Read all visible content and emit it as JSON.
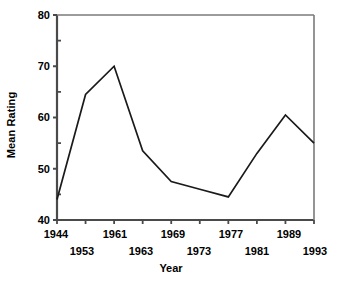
{
  "chart_data": {
    "type": "line",
    "title": "",
    "xlabel": "Year",
    "ylabel": "Mean Rating",
    "xlim": [
      1944,
      1993
    ],
    "ylim": [
      40,
      80
    ],
    "grid": false,
    "legend": null,
    "y_ticks": [
      40,
      50,
      60,
      70,
      80
    ],
    "y_tick_labels": [
      "40",
      "50",
      "60",
      "70",
      "80"
    ],
    "y_minor_ticks": [
      45,
      55,
      65,
      75
    ],
    "x_ticks": [
      1944,
      1953,
      1961,
      1963,
      1969,
      1973,
      1977,
      1981,
      1989,
      1993
    ],
    "x_tick_labels": [
      "1944",
      "1953",
      "1961",
      "1963",
      "1969",
      "1973",
      "1977",
      "1981",
      "1989",
      "1993"
    ],
    "x_tick_label_rows": [
      0,
      1,
      0,
      1,
      0,
      1,
      0,
      1,
      0,
      1
    ],
    "series": [
      {
        "name": "Mean Rating",
        "color": "#1a1a1a",
        "x": [
          1944,
          1953,
          1961,
          1963,
          1969,
          1973,
          1977,
          1981,
          1989,
          1993
        ],
        "values": [
          44.0,
          64.5,
          70.0,
          53.5,
          47.5,
          46.0,
          44.5,
          53.0,
          60.5,
          55.0
        ]
      }
    ]
  },
  "axis": {
    "y_title": "Mean Rating",
    "x_title": "Year",
    "y_labels": {
      "t80": "80",
      "t70": "70",
      "t60": "60",
      "t50": "50",
      "t40": "40"
    },
    "x_labels": {
      "t1944": "1944",
      "t1953": "1953",
      "t1961": "1961",
      "t1963": "1963",
      "t1969": "1969",
      "t1973": "1973",
      "t1977": "1977",
      "t1981": "1981",
      "t1989": "1989",
      "t1993": "1993"
    }
  },
  "style": {
    "line_color": "#1a1a1a",
    "axis_color": "#4a4a4a",
    "background": "#ffffff"
  }
}
